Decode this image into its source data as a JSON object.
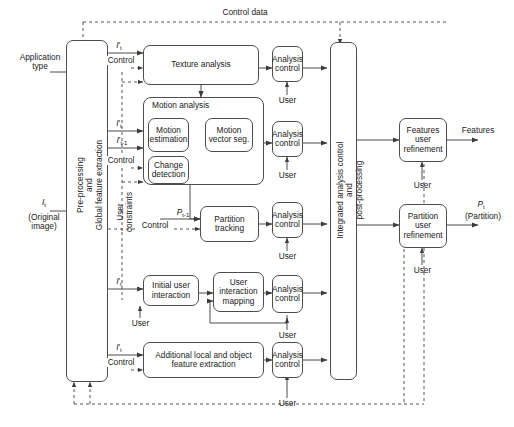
{
  "diagram": {
    "title_flow": "Control data",
    "inputs": [
      {
        "id": "application-type",
        "line1": "Application",
        "line2": "type"
      },
      {
        "id": "original-image",
        "line1": "I t",
        "line2": "(Original",
        "line3": "image)"
      }
    ],
    "outputs": [
      {
        "id": "features",
        "label": "Features"
      },
      {
        "id": "partition",
        "line1": "P t",
        "line2": "(Partition)"
      }
    ],
    "left_column": {
      "line1": "Pre-processing",
      "line2": "and",
      "line3": "Global feature extraction"
    },
    "right_column": {
      "line1": "Integrated analysis control",
      "line2": "and",
      "line3": "post-processing"
    },
    "signals": {
      "it_prime_1": "I't",
      "it_prime_2": "I't",
      "it_minus_1": "I't-1",
      "it_prime_3": "I't",
      "it_prime_4": "I't",
      "pt_minus_1": "P t-1",
      "control_1": "Control",
      "control_2": "Control",
      "control_3": "Control",
      "control_4": "Control",
      "user_constraints": "User constraints"
    },
    "blocks": [
      {
        "id": "texture-analysis",
        "label": "Texture analysis"
      },
      {
        "id": "motion-analysis-group",
        "label": "Motion analysis"
      },
      {
        "id": "motion-estimation",
        "line1": "Motion",
        "line2": "estimation"
      },
      {
        "id": "motion-vector-seg",
        "line1": "Motion",
        "line2": "vector seg."
      },
      {
        "id": "change-detection",
        "line1": "Change",
        "line2": "detection"
      },
      {
        "id": "partition-tracking",
        "line1": "Partition",
        "line2": "tracking"
      },
      {
        "id": "initial-user-interaction",
        "line1": "Initial user",
        "line2": "interaction"
      },
      {
        "id": "user-interaction-mapping",
        "line1": "User",
        "line2": "interaction",
        "line3": "mapping"
      },
      {
        "id": "additional-feature-extraction",
        "line1": "Additional local and object",
        "line2": "feature extraction"
      },
      {
        "id": "features-user-refinement",
        "line1": "Features",
        "line2": "user",
        "line3": "refinement"
      },
      {
        "id": "partition-user-refinement",
        "line1": "Partition",
        "line2": "user",
        "line3": "refinement"
      }
    ],
    "analysis_controls": [
      {
        "id": "analysis-control-1",
        "line1": "Analysis",
        "line2": "control"
      },
      {
        "id": "analysis-control-2",
        "line1": "Analysis",
        "line2": "control"
      },
      {
        "id": "analysis-control-3",
        "line1": "Analysis",
        "line2": "control"
      },
      {
        "id": "analysis-control-4",
        "line1": "Analysis",
        "line2": "control"
      },
      {
        "id": "analysis-control-5",
        "line1": "Analysis",
        "line2": "control"
      }
    ],
    "user_labels": [
      {
        "id": "user-1",
        "label": "User"
      },
      {
        "id": "user-2",
        "label": "User"
      },
      {
        "id": "user-3",
        "label": "User"
      },
      {
        "id": "user-4",
        "label": "User"
      },
      {
        "id": "user-5",
        "label": "User"
      },
      {
        "id": "user-6",
        "label": "User"
      },
      {
        "id": "user-7",
        "label": "User"
      },
      {
        "id": "user-8",
        "label": "User"
      }
    ],
    "colors": {
      "stroke": "#4d4d4d",
      "text": "#1a1a1a",
      "background": "#ffffff",
      "dashed": "#555555"
    }
  }
}
